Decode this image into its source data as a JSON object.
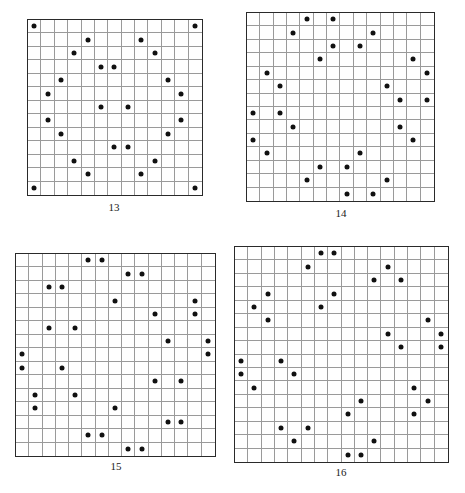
{
  "puzzles": [
    {
      "label": "13",
      "size": 13,
      "box": {
        "x": 27,
        "y": 19,
        "w": 176,
        "h": 177
      },
      "label_pos": {
        "x": 94,
        "y": 201
      },
      "dots": [
        [
          0,
          0
        ],
        [
          0,
          12
        ],
        [
          1,
          4
        ],
        [
          1,
          8
        ],
        [
          2,
          3
        ],
        [
          2,
          9
        ],
        [
          3,
          5
        ],
        [
          3,
          6
        ],
        [
          4,
          2
        ],
        [
          4,
          10
        ],
        [
          5,
          1
        ],
        [
          5,
          11
        ],
        [
          6,
          5
        ],
        [
          6,
          7
        ],
        [
          7,
          1
        ],
        [
          7,
          11
        ],
        [
          8,
          2
        ],
        [
          8,
          10
        ],
        [
          9,
          6
        ],
        [
          9,
          7
        ],
        [
          10,
          3
        ],
        [
          10,
          9
        ],
        [
          11,
          4
        ],
        [
          11,
          8
        ],
        [
          12,
          0
        ],
        [
          12,
          12
        ]
      ]
    },
    {
      "label": "14",
      "size": 14,
      "box": {
        "x": 246,
        "y": 12,
        "w": 189,
        "h": 190
      },
      "label_pos": {
        "x": 321,
        "y": 207
      },
      "dots": [
        [
          0,
          4
        ],
        [
          0,
          6
        ],
        [
          1,
          3
        ],
        [
          1,
          9
        ],
        [
          2,
          6
        ],
        [
          2,
          8
        ],
        [
          3,
          5
        ],
        [
          3,
          12
        ],
        [
          4,
          1
        ],
        [
          4,
          13
        ],
        [
          5,
          2
        ],
        [
          5,
          10
        ],
        [
          6,
          11
        ],
        [
          6,
          13
        ],
        [
          7,
          0
        ],
        [
          7,
          2
        ],
        [
          8,
          3
        ],
        [
          8,
          11
        ],
        [
          9,
          0
        ],
        [
          9,
          12
        ],
        [
          10,
          1
        ],
        [
          10,
          8
        ],
        [
          11,
          5
        ],
        [
          11,
          7
        ],
        [
          12,
          4
        ],
        [
          12,
          10
        ],
        [
          13,
          7
        ],
        [
          13,
          9
        ]
      ]
    },
    {
      "label": "15",
      "size": 15,
      "box": {
        "x": 15,
        "y": 253,
        "w": 201,
        "h": 204
      },
      "label_pos": {
        "x": 96,
        "y": 460
      },
      "dots": [
        [
          0,
          5
        ],
        [
          0,
          6
        ],
        [
          1,
          8
        ],
        [
          1,
          9
        ],
        [
          2,
          2
        ],
        [
          2,
          3
        ],
        [
          3,
          7
        ],
        [
          3,
          13
        ],
        [
          4,
          10
        ],
        [
          4,
          13
        ],
        [
          5,
          2
        ],
        [
          5,
          4
        ],
        [
          6,
          11
        ],
        [
          6,
          14
        ],
        [
          7,
          0
        ],
        [
          7,
          14
        ],
        [
          8,
          0
        ],
        [
          8,
          3
        ],
        [
          9,
          10
        ],
        [
          9,
          12
        ],
        [
          10,
          1
        ],
        [
          10,
          4
        ],
        [
          11,
          1
        ],
        [
          11,
          7
        ],
        [
          12,
          11
        ],
        [
          12,
          12
        ],
        [
          13,
          5
        ],
        [
          13,
          6
        ],
        [
          14,
          8
        ],
        [
          14,
          9
        ]
      ]
    },
    {
      "label": "16",
      "size": 16,
      "box": {
        "x": 234,
        "y": 246,
        "w": 215,
        "h": 217
      },
      "label_pos": {
        "x": 321,
        "y": 466
      },
      "dots": [
        [
          0,
          6
        ],
        [
          0,
          7
        ],
        [
          1,
          5
        ],
        [
          1,
          11
        ],
        [
          2,
          10
        ],
        [
          2,
          12
        ],
        [
          3,
          2
        ],
        [
          3,
          7
        ],
        [
          4,
          1
        ],
        [
          4,
          6
        ],
        [
          5,
          2
        ],
        [
          5,
          14
        ],
        [
          6,
          11
        ],
        [
          6,
          15
        ],
        [
          7,
          12
        ],
        [
          7,
          15
        ],
        [
          8,
          0
        ],
        [
          8,
          3
        ],
        [
          9,
          0
        ],
        [
          9,
          4
        ],
        [
          10,
          1
        ],
        [
          10,
          13
        ],
        [
          11,
          9
        ],
        [
          11,
          14
        ],
        [
          12,
          8
        ],
        [
          12,
          13
        ],
        [
          13,
          3
        ],
        [
          13,
          5
        ],
        [
          14,
          4
        ],
        [
          14,
          10
        ],
        [
          15,
          8
        ],
        [
          15,
          9
        ]
      ]
    }
  ]
}
